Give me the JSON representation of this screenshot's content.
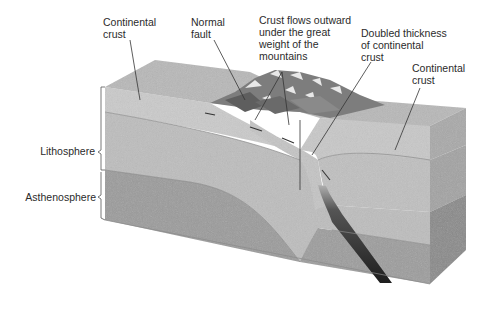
{
  "figure": {
    "labels": {
      "continental_crust_left": "Continental\ncrust",
      "normal_fault": "Normal\nfault",
      "crust_flows": "Crust flows outward\nunder the great\nweight of the\nmountains",
      "doubled_thickness": "Doubled thickness\nof continental\ncrust",
      "continental_crust_right": "Continental\ncrust",
      "lithosphere": "Lithosphere",
      "asthenosphere": "Asthenosphere"
    },
    "colors": {
      "surface_top": "#b9b9b9",
      "crust_front": "#c9c9c9",
      "lithosphere_mantle": "#bdbdbd",
      "asthenosphere": "#9d9d9d",
      "side_crust": "#a9a9a9",
      "side_lithosphere": "#a3a3a3",
      "side_asthenosphere": "#8a8a8a",
      "slab": "#2a2a2a",
      "leader_line": "#333333",
      "text": "#2b2b2b"
    }
  }
}
